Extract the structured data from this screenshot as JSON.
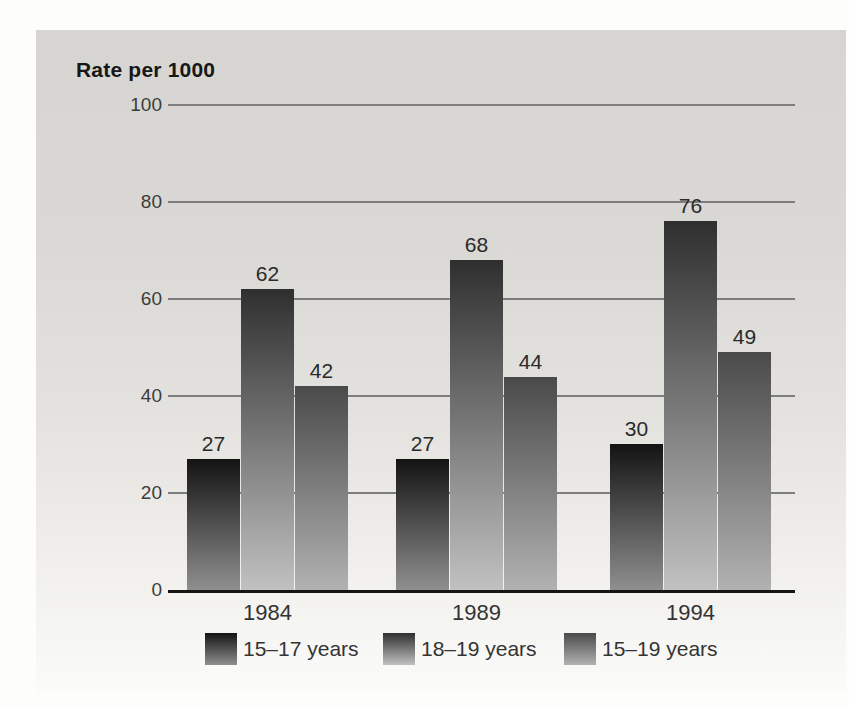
{
  "chart_data": {
    "type": "bar",
    "title": "Rate per 1000",
    "categories": [
      "1984",
      "1989",
      "1994"
    ],
    "series": [
      {
        "name": "15–17 years",
        "values": [
          27,
          27,
          30
        ],
        "color_top": "#131313",
        "color_bottom": "#8f8f8f"
      },
      {
        "name": "18–19 years",
        "values": [
          62,
          68,
          76
        ],
        "color_top": "#2f2f2f",
        "color_bottom": "#c1c1c1"
      },
      {
        "name": "15–19 years",
        "values": [
          42,
          44,
          49
        ],
        "color_top": "#4a4a4a",
        "color_bottom": "#b2b2b2"
      }
    ],
    "ylim": [
      0,
      100
    ],
    "yticks": [
      0,
      20,
      40,
      60,
      80,
      100
    ],
    "grid": true,
    "value_labels_shown": true,
    "legend_position": "bottom"
  },
  "colors": {
    "panel_top": "#d6d5d1",
    "panel_bottom": "#fbfbf9",
    "gridline": "#7d7d7d",
    "axis_line": "#141414",
    "text": "#2a2a2a"
  }
}
